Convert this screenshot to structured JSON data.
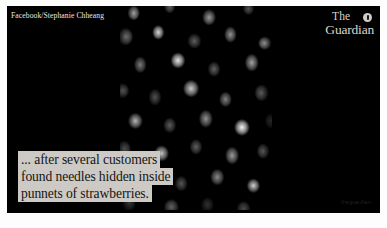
{
  "media": {
    "credit": "Facebook/Stephanie Chheang",
    "watermark": "theguardian",
    "background_color": "#000000",
    "photo_subject": "punnets-of-strawberries"
  },
  "masthead": {
    "line1": "The",
    "line2": "Guardian",
    "badge_icon": "info-badge-icon",
    "color": "#d8d4cf"
  },
  "caption": {
    "background_color": "#cdcac5",
    "text_color": "#141414",
    "lines": [
      "... after several customers",
      "found needles hidden inside",
      "punnets of strawberries."
    ],
    "full_text": "... after several customers found needles hidden inside punnets of strawberries."
  }
}
